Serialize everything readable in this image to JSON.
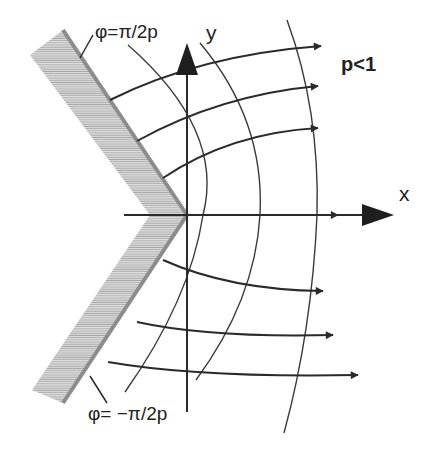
{
  "diagram": {
    "labels": {
      "upper_wall": "φ=π/2p",
      "lower_wall": "φ= −π/2p",
      "y_axis": "y",
      "x_axis": "x",
      "condition": "p<1"
    },
    "colors": {
      "line": "#2a2a2a",
      "wall_edge": "#8c8c8c",
      "hatch": "#b8b8b8",
      "background": "#ffffff"
    },
    "elements": {
      "walls": 2,
      "field_lines": 7,
      "equipotential_arcs": 3
    }
  }
}
